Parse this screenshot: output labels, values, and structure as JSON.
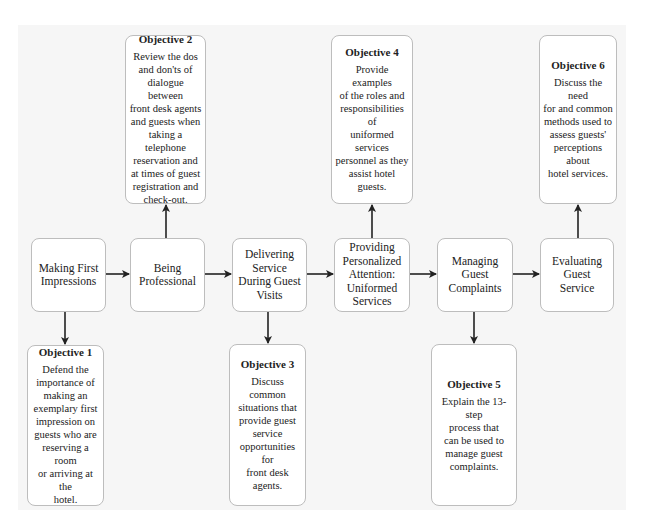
{
  "diagram": {
    "type": "flowchart",
    "colors": {
      "panel_background": "#f6f6f6",
      "box_fill": "#ffffff",
      "box_border": "#bdbdbd",
      "arrow": "#222222"
    },
    "main_flow": [
      {
        "id": "step1",
        "label": "Making First\nImpressions"
      },
      {
        "id": "step2",
        "label": "Being\nProfessional"
      },
      {
        "id": "step3",
        "label": "Delivering\nService\nDuring Guest\nVisits"
      },
      {
        "id": "step4",
        "label": "Providing\nPersonalized\nAttention:\nUniformed\nServices"
      },
      {
        "id": "step5",
        "label": "Managing\nGuest\nComplaints"
      },
      {
        "id": "step6",
        "label": "Evaluating\nGuest\nService"
      }
    ],
    "objectives": [
      {
        "id": "obj1",
        "title": "Objective 1",
        "text": "Defend the\nimportance of\nmaking an\nexemplary first\nimpression on\nguests who are\nreserving a room\nor arriving at the\nhotel.",
        "linked_step": "step1",
        "position": "below"
      },
      {
        "id": "obj2",
        "title": "Objective 2",
        "text": "Review the dos\nand don'ts of\ndialogue between\nfront desk agents\nand guests when\ntaking a telephone\nreservation and\nat times of guest\nregistration and\ncheck-out.",
        "linked_step": "step2",
        "position": "above"
      },
      {
        "id": "obj3",
        "title": "Objective 3",
        "text": "Discuss common\nsituations that\nprovide guest\nservice\nopportunities for\nfront desk agents.",
        "linked_step": "step3",
        "position": "below"
      },
      {
        "id": "obj4",
        "title": "Objective 4",
        "text": "Provide examples\nof the roles and\nresponsibilities of\nuniformed services\npersonnel as they\nassist hotel guests.",
        "linked_step": "step4",
        "position": "above"
      },
      {
        "id": "obj5",
        "title": "Objective 5",
        "text": "Explain the 13-step\nprocess that\ncan be used to\nmanage guest\ncomplaints.",
        "linked_step": "step5",
        "position": "below"
      },
      {
        "id": "obj6",
        "title": "Objective 6",
        "text": "Discuss the need\nfor and common\nmethods used to\nassess guests'\nperceptions about\nhotel services.",
        "linked_step": "step6",
        "position": "above"
      }
    ]
  }
}
